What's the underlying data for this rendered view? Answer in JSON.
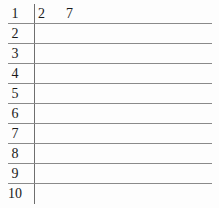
{
  "figure": {
    "type": "stem-and-leaf-plot",
    "background_color": "#fdfdfd",
    "rule_color": "#8a8a8a",
    "divider_color": "#6e6e6e",
    "text_color": "#1a1a1a"
  },
  "rows": [
    {
      "stem": "1",
      "leaves": [
        "2",
        "7"
      ]
    },
    {
      "stem": "2",
      "leaves": []
    },
    {
      "stem": "3",
      "leaves": []
    },
    {
      "stem": "4",
      "leaves": []
    },
    {
      "stem": "5",
      "leaves": []
    },
    {
      "stem": "6",
      "leaves": []
    },
    {
      "stem": "7",
      "leaves": []
    },
    {
      "stem": "8",
      "leaves": []
    },
    {
      "stem": "9",
      "leaves": []
    },
    {
      "stem": "10",
      "leaves": []
    }
  ]
}
